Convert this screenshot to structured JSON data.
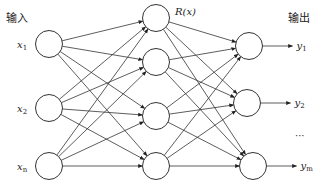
{
  "diagram": {
    "type": "feedforward-neural-network",
    "labels": {
      "input_title": "输入",
      "output_title": "输出",
      "hidden_activation": "R(x)",
      "ellipsis": "···"
    },
    "input_layer": [
      {
        "name": "x",
        "sub": "1"
      },
      {
        "name": "x",
        "sub": "2"
      },
      {
        "name": "x",
        "sub": "n"
      }
    ],
    "hidden_layer_count": 4,
    "output_layer": [
      {
        "name": "y",
        "sub": "1"
      },
      {
        "name": "y",
        "sub": "2"
      },
      {
        "name": "y",
        "sub": "m"
      }
    ],
    "connections": "fully-connected"
  }
}
